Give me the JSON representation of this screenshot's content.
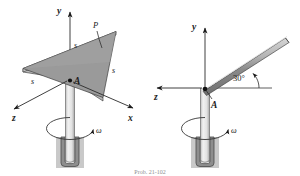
{
  "figure": {
    "caption": "Prob. 21-102",
    "background_color": "#ffffff",
    "ink_color": "#1a1a1a",
    "plate_fill": "#8f8f8f",
    "plate_edge_fill": "#c6c6c6",
    "rod_fill": "#8f8f8f",
    "rod_highlight": "#d4d4d4",
    "base_fill": "#c9c9c9",
    "socket_fill": "#8a8a8a",
    "shaft_fill": "#e8e8e8"
  },
  "left_figure": {
    "name": "triangular-plate-on-rotating-shaft",
    "axes": {
      "y": "y",
      "x": "x",
      "z": "z"
    },
    "point_label": "A",
    "body_label": "P",
    "side_labels": [
      "s",
      "s",
      "s"
    ],
    "omega_label": "ω"
  },
  "right_figure": {
    "name": "inclined-rod-on-rotating-shaft",
    "axes": {
      "y": "y",
      "z": "z"
    },
    "point_label": "A",
    "angle_label": "30°",
    "omega_label": "ω"
  }
}
